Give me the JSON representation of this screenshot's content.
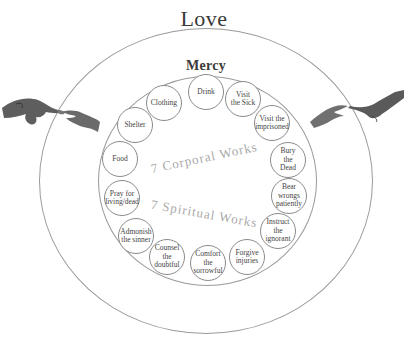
{
  "title": "Love",
  "subtitle": "Mercy",
  "center_labels": {
    "corporal": "7 Corporal Works",
    "spiritual": "7 Spiritual Works"
  },
  "corporal_works": [
    {
      "label": "Drink",
      "x": 206,
      "y": 92
    },
    {
      "label": "Visit\nthe Sick",
      "x": 243,
      "y": 99
    },
    {
      "label": "Visit the\nimprisoned",
      "x": 272,
      "y": 123
    },
    {
      "label": "Bury\nthe\nDead",
      "x": 288,
      "y": 160
    },
    {
      "label": "Bear\nwrongs\npatiently",
      "x": 289,
      "y": 196
    },
    {
      "label": "Instruct\nthe\nignorant",
      "x": 278,
      "y": 231
    },
    {
      "label": "Forgive\ninjuries",
      "x": 247,
      "y": 257
    }
  ],
  "spiritual_works": [
    {
      "label": "Comfort\nthe\nsorrowful",
      "x": 208,
      "y": 263
    },
    {
      "label": "Counsel\nthe\ndoubtful",
      "x": 167,
      "y": 257
    },
    {
      "label": "Admonish\nthe sinner",
      "x": 136,
      "y": 236
    },
    {
      "label": "Pray for\nliving/dead",
      "x": 122,
      "y": 198
    },
    {
      "label": "Food",
      "x": 120,
      "y": 159
    },
    {
      "label": "Shelter",
      "x": 135,
      "y": 125
    },
    {
      "label": "Clothing",
      "x": 164,
      "y": 103
    }
  ],
  "images": {
    "left_hand": "hand-of-god-icon",
    "right_hand": "hand-of-adam-icon"
  }
}
